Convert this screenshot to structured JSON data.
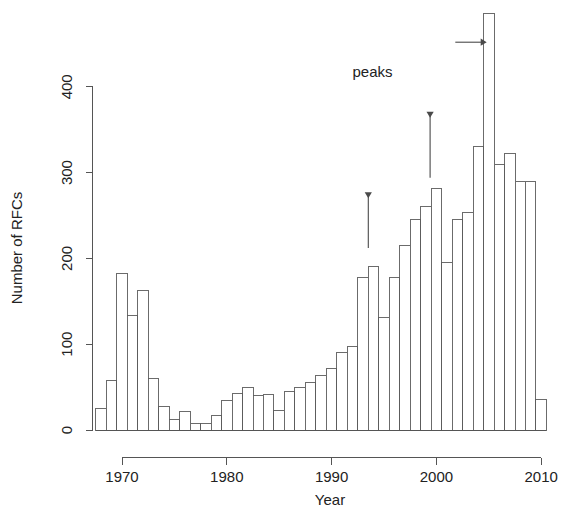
{
  "chart_data": {
    "type": "bar",
    "title": "",
    "subtitle": "",
    "xlabel": "Year",
    "ylabel": "Number of RFCs",
    "xlim": [
      1968,
      2011
    ],
    "ylim": [
      0,
      500
    ],
    "grid": false,
    "legend": null,
    "xticks": [
      1970,
      1980,
      1990,
      2000,
      2010
    ],
    "xtick_labels": [
      "1970",
      "1980",
      "1990",
      "2000",
      "2010"
    ],
    "yticks": [
      0,
      100,
      200,
      300,
      400
    ],
    "ytick_labels": [
      "0",
      "100",
      "200",
      "300",
      "400"
    ],
    "categories": [
      1968,
      1969,
      1970,
      1971,
      1972,
      1973,
      1974,
      1975,
      1976,
      1977,
      1978,
      1979,
      1980,
      1981,
      1982,
      1983,
      1984,
      1985,
      1986,
      1987,
      1988,
      1989,
      1990,
      1991,
      1992,
      1993,
      1994,
      1995,
      1996,
      1997,
      1998,
      1999,
      2000,
      2001,
      2002,
      2003,
      2004,
      2005,
      2006,
      2007,
      2008,
      2009,
      2010
    ],
    "values": [
      25,
      58,
      182,
      133,
      163,
      60,
      27,
      12,
      21,
      8,
      7,
      17,
      34,
      43,
      50,
      40,
      41,
      23,
      45,
      50,
      55,
      64,
      72,
      90,
      97,
      178,
      190,
      131,
      178,
      215,
      245,
      260,
      281,
      195,
      245,
      253,
      330,
      485,
      310,
      322,
      290,
      290,
      36
    ],
    "annotations": [
      {
        "id": "peaks-label",
        "kind": "text",
        "text": "peaks",
        "x": 1993.9,
        "y": 412
      },
      {
        "id": "arrow-1994",
        "kind": "arrow-down",
        "text": "",
        "x": 1993.5,
        "y_from": 270,
        "y_to": 212
      },
      {
        "id": "arrow-1999",
        "kind": "arrow-down",
        "text": "",
        "x": 1999.4,
        "y_from": 364,
        "y_to": 294
      },
      {
        "id": "arrow-2005",
        "kind": "arrow-right",
        "text": "",
        "x_from": 2001.8,
        "x_to": 2004.8,
        "y": 452
      }
    ]
  },
  "axis": {
    "y_title": "Number of RFCs",
    "x_title": "Year"
  },
  "annotation_text": {
    "peaks": "peaks"
  }
}
